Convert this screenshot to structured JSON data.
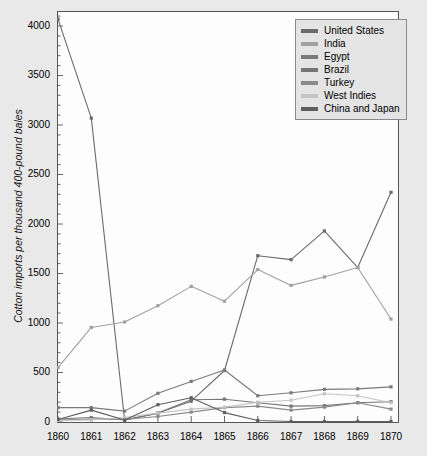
{
  "chart_data": {
    "type": "line",
    "title": "",
    "xlabel": "",
    "ylabel": "Cotton imports per thousand 400-pound bales",
    "categories": [
      "1860",
      "1861",
      "1862",
      "1863",
      "1864",
      "1865",
      "1866",
      "1867",
      "1868",
      "1869",
      "1870"
    ],
    "x": [
      1860,
      1861,
      1862,
      1863,
      1864,
      1865,
      1866,
      1867,
      1868,
      1869,
      1870
    ],
    "xlim": [
      1860,
      1870
    ],
    "ylim": [
      0,
      4150
    ],
    "yticks": [
      0,
      500,
      1000,
      1500,
      2000,
      2500,
      3000,
      3500,
      4000
    ],
    "xticks": [
      1860,
      1861,
      1862,
      1863,
      1864,
      1865,
      1866,
      1867,
      1868,
      1869,
      1870
    ],
    "grid": false,
    "legend_position": "top-right",
    "markers": "square",
    "series": [
      {
        "name": "United States",
        "color": "#6b6b6b",
        "values": [
          4070,
          3070,
          20,
          90,
          210,
          520,
          1680,
          1640,
          1930,
          1560,
          2320
        ]
      },
      {
        "name": "India",
        "color": "#a0a0a0",
        "values": [
          550,
          955,
          1010,
          1175,
          1370,
          1220,
          1540,
          1380,
          1465,
          1560,
          1040
        ]
      },
      {
        "name": "Egypt",
        "color": "#7a7a7a",
        "values": [
          145,
          145,
          110,
          290,
          410,
          525,
          265,
          295,
          330,
          335,
          355
        ]
      },
      {
        "name": "Brazil",
        "color": "#757575",
        "values": [
          30,
          45,
          20,
          90,
          225,
          230,
          195,
          160,
          165,
          195,
          205
        ]
      },
      {
        "name": "Turkey",
        "color": "#8a8a8a",
        "values": [
          20,
          30,
          25,
          55,
          100,
          145,
          160,
          120,
          150,
          195,
          130
        ]
      },
      {
        "name": "West Indies",
        "color": "#c4c4c4",
        "values": [
          15,
          20,
          45,
          90,
          130,
          150,
          200,
          220,
          285,
          265,
          195
        ]
      },
      {
        "name": "China and Japan",
        "color": "#5e5e5e",
        "values": [
          25,
          120,
          20,
          175,
          245,
          95,
          15,
          5,
          5,
          5,
          5
        ]
      }
    ]
  },
  "legend": {
    "items": [
      {
        "label": "United States"
      },
      {
        "label": "India"
      },
      {
        "label": "Egypt"
      },
      {
        "label": "Brazil"
      },
      {
        "label": "Turkey"
      },
      {
        "label": "West Indies"
      },
      {
        "label": "China and Japan"
      }
    ]
  },
  "axes": {
    "y_label": "Cotton imports per thousand 400-pound bales",
    "y_tick_labels": [
      "0",
      "500",
      "1000",
      "1500",
      "2000",
      "2500",
      "3000",
      "3500",
      "4000"
    ],
    "x_tick_labels": [
      "1860",
      "1861",
      "1862",
      "1863",
      "1864",
      "1865",
      "1866",
      "1867",
      "1868",
      "1869",
      "1870"
    ]
  },
  "colors": {
    "figure_background": "#e9e9e9",
    "plot_background": "#fdfdfd",
    "axis": "#555555",
    "text": "#000000"
  }
}
